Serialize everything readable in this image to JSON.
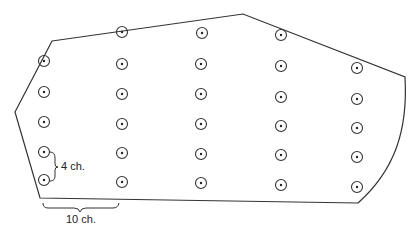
{
  "diagram": {
    "type": "crochet/knitting shape chart with marker grid",
    "outline_points": [
      [
        52,
        41
      ],
      [
        243,
        14
      ],
      [
        405,
        77
      ]
    ],
    "outline_bottom": [
      [
        358,
        203
      ],
      [
        40,
        198
      ],
      [
        15,
        112
      ]
    ],
    "markers": [
      {
        "x": 44,
        "y": 61
      },
      {
        "x": 44,
        "y": 92
      },
      {
        "x": 44,
        "y": 122
      },
      {
        "x": 44,
        "y": 152
      },
      {
        "x": 44,
        "y": 180
      },
      {
        "x": 122,
        "y": 32
      },
      {
        "x": 122,
        "y": 64
      },
      {
        "x": 122,
        "y": 94
      },
      {
        "x": 122,
        "y": 124
      },
      {
        "x": 122,
        "y": 153
      },
      {
        "x": 122,
        "y": 182
      },
      {
        "x": 202,
        "y": 33
      },
      {
        "x": 201,
        "y": 64
      },
      {
        "x": 201,
        "y": 94
      },
      {
        "x": 201,
        "y": 124
      },
      {
        "x": 201,
        "y": 154
      },
      {
        "x": 201,
        "y": 183
      },
      {
        "x": 281,
        "y": 35
      },
      {
        "x": 281,
        "y": 66
      },
      {
        "x": 281,
        "y": 97
      },
      {
        "x": 281,
        "y": 126
      },
      {
        "x": 281,
        "y": 155
      },
      {
        "x": 281,
        "y": 185
      },
      {
        "x": 357,
        "y": 68
      },
      {
        "x": 357,
        "y": 99
      },
      {
        "x": 357,
        "y": 128
      },
      {
        "x": 357,
        "y": 157
      },
      {
        "x": 357,
        "y": 187
      }
    ],
    "vertical_spacing_label": "4 ch.",
    "horizontal_spacing_label": "10 ch.",
    "line_color": "#333333"
  }
}
